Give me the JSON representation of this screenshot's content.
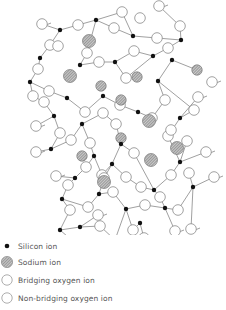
{
  "diagram": {
    "colors": {
      "silicon": "#111111",
      "oxygen_stroke": "#8a8a8a",
      "sodium_fill": "#9a9a9a",
      "bond": "#777777"
    },
    "silicon": [
      [
        60,
        30
      ],
      [
        96,
        20
      ],
      [
        133,
        36
      ],
      [
        181,
        40
      ],
      [
        40,
        58
      ],
      [
        80,
        65
      ],
      [
        115,
        62
      ],
      [
        153,
        56
      ],
      [
        30,
        82
      ],
      [
        67,
        98
      ],
      [
        158,
        81
      ],
      [
        172,
        60
      ],
      [
        180,
        118
      ],
      [
        54,
        116
      ],
      [
        103,
        96
      ],
      [
        138,
        112
      ],
      [
        82,
        124
      ],
      [
        51,
        149
      ],
      [
        121,
        144
      ],
      [
        94,
        156
      ],
      [
        75,
        178
      ],
      [
        112,
        164
      ],
      [
        154,
        190
      ],
      [
        180,
        162
      ],
      [
        99,
        194
      ],
      [
        62,
        199
      ],
      [
        126,
        209
      ],
      [
        165,
        208
      ],
      [
        193,
        187
      ],
      [
        140,
        223
      ],
      [
        115,
        240
      ],
      [
        80,
        227
      ],
      [
        60,
        230
      ]
    ],
    "bridging_oxygen": [
      [
        78,
        25
      ],
      [
        114,
        28
      ],
      [
        157,
        38
      ],
      [
        122,
        12
      ],
      [
        50,
        45
      ],
      [
        58,
        46
      ],
      [
        87,
        53
      ],
      [
        99,
        62
      ],
      [
        134,
        51
      ],
      [
        168,
        48
      ],
      [
        140,
        18
      ],
      [
        180,
        26
      ],
      [
        38,
        69
      ],
      [
        33,
        96
      ],
      [
        49,
        91
      ],
      [
        85,
        112
      ],
      [
        126,
        78
      ],
      [
        165,
        100
      ],
      [
        194,
        110
      ],
      [
        168,
        136
      ],
      [
        171,
        130
      ],
      [
        187,
        141
      ],
      [
        44,
        102
      ],
      [
        60,
        133
      ],
      [
        71,
        140
      ],
      [
        103,
        113
      ],
      [
        152,
        118
      ],
      [
        116,
        124
      ],
      [
        134,
        153
      ],
      [
        113,
        192
      ],
      [
        86,
        167
      ],
      [
        90,
        143
      ],
      [
        102,
        175
      ],
      [
        126,
        177
      ],
      [
        141,
        187
      ],
      [
        171,
        175
      ],
      [
        189,
        173
      ],
      [
        178,
        210
      ],
      [
        133,
        230
      ],
      [
        88,
        207
      ],
      [
        70,
        210
      ],
      [
        100,
        226
      ],
      [
        104,
        178
      ],
      [
        145,
        205
      ],
      [
        160,
        197
      ],
      [
        68,
        185
      ],
      [
        120,
        105
      ]
    ],
    "nonbridging_oxygen": [
      [
        42,
        24
      ],
      [
        159,
        6
      ],
      [
        212,
        82
      ],
      [
        198,
        97
      ],
      [
        36,
        126
      ],
      [
        36,
        152
      ],
      [
        206,
        152
      ],
      [
        214,
        177
      ],
      [
        56,
        176
      ],
      [
        98,
        215
      ],
      [
        130,
        255
      ],
      [
        175,
        231
      ],
      [
        191,
        229
      ],
      [
        75,
        243
      ],
      [
        112,
        262
      ],
      [
        144,
        238
      ]
    ],
    "sodium": [
      [
        89,
        41
      ],
      [
        70,
        76
      ],
      [
        101,
        86
      ],
      [
        137,
        77
      ],
      [
        121,
        100
      ],
      [
        149,
        121
      ],
      [
        121,
        138
      ],
      [
        82,
        156
      ],
      [
        151,
        160
      ],
      [
        104,
        182
      ],
      [
        177,
        148
      ],
      [
        197,
        70
      ]
    ],
    "bonds": [
      [
        [
          42,
          24
        ],
        [
          60,
          30
        ]
      ],
      [
        [
          60,
          30
        ],
        [
          78,
          25
        ]
      ],
      [
        [
          78,
          25
        ],
        [
          96,
          20
        ]
      ],
      [
        [
          96,
          20
        ],
        [
          114,
          28
        ]
      ],
      [
        [
          114,
          28
        ],
        [
          133,
          36
        ]
      ],
      [
        [
          133,
          36
        ],
        [
          157,
          38
        ]
      ],
      [
        [
          157,
          38
        ],
        [
          181,
          40
        ]
      ],
      [
        [
          96,
          20
        ],
        [
          122,
          12
        ]
      ],
      [
        [
          122,
          12
        ],
        [
          133,
          36
        ]
      ],
      [
        [
          60,
          30
        ],
        [
          50,
          45
        ]
      ],
      [
        [
          50,
          45
        ],
        [
          40,
          58
        ]
      ],
      [
        [
          40,
          58
        ],
        [
          38,
          69
        ]
      ],
      [
        [
          38,
          69
        ],
        [
          30,
          82
        ]
      ],
      [
        [
          80,
          65
        ],
        [
          87,
          53
        ]
      ],
      [
        [
          87,
          53
        ],
        [
          96,
          20
        ]
      ],
      [
        [
          80,
          65
        ],
        [
          99,
          62
        ]
      ],
      [
        [
          99,
          62
        ],
        [
          115,
          62
        ]
      ],
      [
        [
          115,
          62
        ],
        [
          134,
          51
        ]
      ],
      [
        [
          134,
          51
        ],
        [
          153,
          56
        ]
      ],
      [
        [
          153,
          56
        ],
        [
          168,
          48
        ]
      ],
      [
        [
          168,
          48
        ],
        [
          181,
          40
        ]
      ],
      [
        [
          181,
          40
        ],
        [
          180,
          26
        ]
      ],
      [
        [
          180,
          26
        ],
        [
          159,
          6
        ]
      ],
      [
        [
          153,
          56
        ],
        [
          126,
          78
        ]
      ],
      [
        [
          30,
          82
        ],
        [
          33,
          96
        ]
      ],
      [
        [
          33,
          96
        ],
        [
          44,
          102
        ]
      ],
      [
        [
          44,
          102
        ],
        [
          54,
          116
        ]
      ],
      [
        [
          30,
          82
        ],
        [
          49,
          91
        ]
      ],
      [
        [
          49,
          91
        ],
        [
          67,
          98
        ]
      ],
      [
        [
          67,
          98
        ],
        [
          85,
          112
        ]
      ],
      [
        [
          85,
          112
        ],
        [
          103,
          96
        ]
      ],
      [
        [
          103,
          96
        ],
        [
          120,
          105
        ]
      ],
      [
        [
          120,
          105
        ],
        [
          138,
          112
        ]
      ],
      [
        [
          138,
          112
        ],
        [
          152,
          118
        ]
      ],
      [
        [
          152,
          118
        ],
        [
          165,
          100
        ]
      ],
      [
        [
          165,
          100
        ],
        [
          158,
          81
        ]
      ],
      [
        [
          158,
          81
        ],
        [
          172,
          60
        ]
      ],
      [
        [
          172,
          60
        ],
        [
          197,
          70
        ]
      ],
      [
        [
          158,
          81
        ],
        [
          194,
          110
        ]
      ],
      [
        [
          194,
          110
        ],
        [
          180,
          118
        ]
      ],
      [
        [
          180,
          118
        ],
        [
          198,
          97
        ]
      ],
      [
        [
          180,
          118
        ],
        [
          168,
          136
        ]
      ],
      [
        [
          168,
          136
        ],
        [
          180,
          162
        ]
      ],
      [
        [
          180,
          162
        ],
        [
          187,
          141
        ]
      ],
      [
        [
          180,
          162
        ],
        [
          206,
          152
        ]
      ],
      [
        [
          54,
          116
        ],
        [
          60,
          133
        ]
      ],
      [
        [
          54,
          116
        ],
        [
          36,
          126
        ]
      ],
      [
        [
          60,
          133
        ],
        [
          51,
          149
        ]
      ],
      [
        [
          51,
          149
        ],
        [
          36,
          152
        ]
      ],
      [
        [
          51,
          149
        ],
        [
          71,
          140
        ]
      ],
      [
        [
          71,
          140
        ],
        [
          82,
          124
        ]
      ],
      [
        [
          82,
          124
        ],
        [
          90,
          143
        ]
      ],
      [
        [
          90,
          143
        ],
        [
          94,
          156
        ]
      ],
      [
        [
          82,
          124
        ],
        [
          103,
          113
        ]
      ],
      [
        [
          103,
          113
        ],
        [
          116,
          124
        ]
      ],
      [
        [
          116,
          124
        ],
        [
          121,
          144
        ]
      ],
      [
        [
          121,
          144
        ],
        [
          134,
          153
        ]
      ],
      [
        [
          134,
          153
        ],
        [
          154,
          190
        ]
      ],
      [
        [
          121,
          144
        ],
        [
          112,
          164
        ]
      ],
      [
        [
          94,
          156
        ],
        [
          86,
          167
        ]
      ],
      [
        [
          86,
          167
        ],
        [
          75,
          178
        ]
      ],
      [
        [
          94,
          156
        ],
        [
          102,
          175
        ]
      ],
      [
        [
          102,
          175
        ],
        [
          112,
          164
        ]
      ],
      [
        [
          112,
          164
        ],
        [
          126,
          177
        ]
      ],
      [
        [
          126,
          177
        ],
        [
          141,
          187
        ]
      ],
      [
        [
          141,
          187
        ],
        [
          154,
          190
        ]
      ],
      [
        [
          154,
          190
        ],
        [
          171,
          175
        ]
      ],
      [
        [
          171,
          175
        ],
        [
          180,
          162
        ]
      ],
      [
        [
          75,
          178
        ],
        [
          68,
          185
        ]
      ],
      [
        [
          68,
          185
        ],
        [
          62,
          199
        ]
      ],
      [
        [
          75,
          178
        ],
        [
          56,
          176
        ]
      ],
      [
        [
          62,
          199
        ],
        [
          70,
          210
        ]
      ],
      [
        [
          70,
          210
        ],
        [
          60,
          230
        ]
      ],
      [
        [
          60,
          230
        ],
        [
          75,
          243
        ]
      ],
      [
        [
          62,
          199
        ],
        [
          88,
          207
        ]
      ],
      [
        [
          88,
          207
        ],
        [
          99,
          194
        ]
      ],
      [
        [
          99,
          194
        ],
        [
          104,
          178
        ]
      ],
      [
        [
          104,
          178
        ],
        [
          112,
          164
        ]
      ],
      [
        [
          99,
          194
        ],
        [
          113,
          192
        ]
      ],
      [
        [
          113,
          192
        ],
        [
          126,
          209
        ]
      ],
      [
        [
          126,
          209
        ],
        [
          145,
          205
        ]
      ],
      [
        [
          145,
          205
        ],
        [
          165,
          208
        ]
      ],
      [
        [
          165,
          208
        ],
        [
          160,
          197
        ]
      ],
      [
        [
          160,
          197
        ],
        [
          154,
          190
        ]
      ],
      [
        [
          165,
          208
        ],
        [
          178,
          210
        ]
      ],
      [
        [
          178,
          210
        ],
        [
          193,
          187
        ]
      ],
      [
        [
          193,
          187
        ],
        [
          189,
          173
        ]
      ],
      [
        [
          193,
          187
        ],
        [
          214,
          177
        ]
      ],
      [
        [
          165,
          208
        ],
        [
          175,
          231
        ]
      ],
      [
        [
          193,
          187
        ],
        [
          191,
          229
        ]
      ],
      [
        [
          126,
          209
        ],
        [
          133,
          230
        ]
      ],
      [
        [
          133,
          230
        ],
        [
          140,
          223
        ]
      ],
      [
        [
          140,
          223
        ],
        [
          144,
          238
        ]
      ],
      [
        [
          126,
          209
        ],
        [
          115,
          240
        ]
      ],
      [
        [
          115,
          240
        ],
        [
          112,
          262
        ]
      ],
      [
        [
          115,
          240
        ],
        [
          100,
          226
        ]
      ],
      [
        [
          100,
          226
        ],
        [
          80,
          227
        ]
      ],
      [
        [
          80,
          227
        ],
        [
          98,
          215
        ]
      ],
      [
        [
          80,
          227
        ],
        [
          60,
          230
        ]
      ],
      [
        [
          115,
          62
        ],
        [
          126,
          78
        ]
      ]
    ]
  },
  "legend": {
    "items": [
      {
        "type": "silicon",
        "label": "Silicon ion"
      },
      {
        "type": "sodium",
        "label": "Sodium ion"
      },
      {
        "type": "bridging",
        "label": "Bridging oxygen ion"
      },
      {
        "type": "nonbridging",
        "label": "Non-bridging oxygen ion"
      }
    ]
  }
}
